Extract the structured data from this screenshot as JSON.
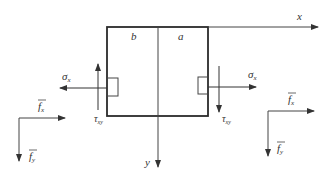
{
  "diagram": {
    "type": "beam-element-stress-diagram",
    "axes": {
      "x_label": "x",
      "y_label": "y"
    },
    "regions": {
      "left": "b",
      "right": "a"
    },
    "left_face": {
      "normal_stress": "σx",
      "shear_stress": "τxy",
      "normal_direction": "left",
      "shear_direction": "up"
    },
    "right_face": {
      "normal_stress": "σx",
      "shear_stress": "τxy",
      "normal_direction": "right",
      "shear_direction": "down"
    },
    "left_body_force": {
      "fx": "f̄x",
      "fy": "f̄y"
    },
    "right_body_force": {
      "fx": "f̄x",
      "fy": "f̄y"
    },
    "labels": {
      "x": "x",
      "y": "y",
      "b": "b",
      "a": "a",
      "sigma_left": "σ",
      "sigma_left_sub": "x",
      "sigma_right": "σ",
      "sigma_right_sub": "x",
      "tau_left": "τ",
      "tau_left_sub": "xy",
      "tau_right": "τ",
      "tau_right_sub": "xy",
      "f_left_x": "f",
      "f_left_x_sub": "x",
      "f_left_y": "f",
      "f_left_y_sub": "y",
      "f_right_x": "f",
      "f_right_x_sub": "x",
      "f_right_y": "f",
      "f_right_y_sub": "y"
    },
    "colors": {
      "line": "#2b2b2b",
      "thin": "#555555"
    }
  }
}
